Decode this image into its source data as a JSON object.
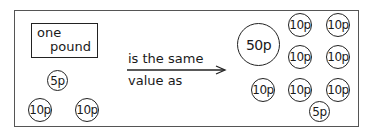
{
  "left_group": {
    "note_label_line1": "one",
    "note_label_line2": "pound",
    "coins": [
      {
        "label": "5p",
        "x": 47,
        "y": 70,
        "size": "c5"
      },
      {
        "label": "10p",
        "x": 28,
        "y": 98,
        "size": "c10"
      },
      {
        "label": "10p",
        "x": 75,
        "y": 98,
        "size": "c10"
      }
    ]
  },
  "relation": {
    "line1": "is the same",
    "line2": "value as"
  },
  "right_group": {
    "coins": [
      {
        "label": "50p",
        "x": 237,
        "y": 23,
        "size": "c50"
      },
      {
        "label": "10p",
        "x": 288,
        "y": 13,
        "size": "c10"
      },
      {
        "label": "10p",
        "x": 326,
        "y": 13,
        "size": "c10"
      },
      {
        "label": "10p",
        "x": 288,
        "y": 45,
        "size": "c10"
      },
      {
        "label": "10p",
        "x": 326,
        "y": 45,
        "size": "c10"
      },
      {
        "label": "10p",
        "x": 251,
        "y": 78,
        "size": "c10"
      },
      {
        "label": "10p",
        "x": 288,
        "y": 78,
        "size": "c10"
      },
      {
        "label": "10p",
        "x": 326,
        "y": 78,
        "size": "c10"
      },
      {
        "label": "5p",
        "x": 309,
        "y": 101,
        "size": "c5"
      }
    ]
  }
}
